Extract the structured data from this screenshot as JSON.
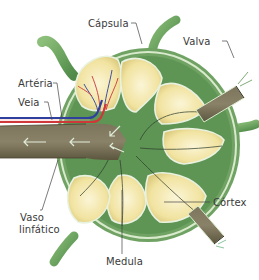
{
  "diagram": {
    "labels": {
      "capsula": "Cápsula",
      "valva": "Valva",
      "arteria": "Artéria",
      "veia": "Veia",
      "vaso_linfatico_line1": "Vaso",
      "vaso_linfatico_line2": "linfático",
      "cortex": "Córtex",
      "medula": "Medula"
    },
    "colors": {
      "capsule_green": "#7aa86a",
      "capsule_light": "#cfe3c4",
      "inner_green": "#5f9a58",
      "follicle_yellow": "#f3e7a8",
      "follicle_center": "#faf3cf",
      "vessel_brown": "#6e6650",
      "artery_red": "#d0373a",
      "vein_blue": "#2f3f9e",
      "leader_line": "#444444"
    }
  }
}
